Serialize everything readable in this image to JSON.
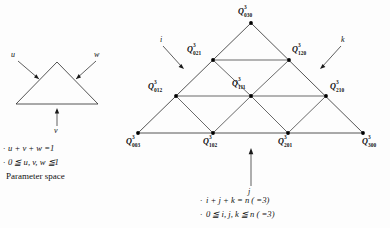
{
  "left_panel": {
    "arrow_labels": {
      "u": "u",
      "w": "w",
      "v": "v"
    },
    "constraints": [
      {
        "bullet": "·",
        "text": "u + v + w =1"
      },
      {
        "bullet": "·",
        "text": "0 ≦ u, v, w ≦1"
      }
    ],
    "caption": "Parameter space"
  },
  "right_panel": {
    "axis_labels": {
      "i": "i",
      "j": "j",
      "k": "k"
    },
    "nodes": [
      {
        "base": "Q",
        "sup": "3",
        "sub": "030",
        "x": 251,
        "y": 23
      },
      {
        "base": "Q",
        "sup": "3",
        "sub": "021",
        "x": 213,
        "y": 60
      },
      {
        "base": "Q",
        "sup": "3",
        "sub": "120",
        "x": 289,
        "y": 60
      },
      {
        "base": "Q",
        "sup": "3",
        "sub": "012",
        "x": 176,
        "y": 96
      },
      {
        "base": "Q",
        "sup": "3",
        "sub": "111",
        "x": 251,
        "y": 96
      },
      {
        "base": "Q",
        "sup": "3",
        "sub": "210",
        "x": 326,
        "y": 96
      },
      {
        "base": "Q",
        "sup": "3",
        "sub": "003",
        "x": 138,
        "y": 133
      },
      {
        "base": "Q",
        "sup": "3",
        "sub": "102",
        "x": 213,
        "y": 133
      },
      {
        "base": "Q",
        "sup": "3",
        "sub": "201",
        "x": 288,
        "y": 133
      },
      {
        "base": "Q",
        "sup": "3",
        "sub": "300",
        "x": 363,
        "y": 133
      }
    ],
    "constraints": [
      {
        "bullet": "·",
        "text": "i + j + k = n ( =3)"
      },
      {
        "bullet": "·",
        "text": "0 ≦ i, j, k ≦ n ( =3)"
      }
    ]
  },
  "colors": {
    "ink": "#1a1a1a",
    "background": "#fdfdfd"
  }
}
